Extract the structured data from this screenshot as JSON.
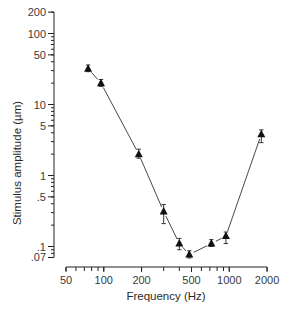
{
  "chart_data": {
    "type": "line",
    "title": "",
    "xlabel": "Frequency (Hz)",
    "ylabel": "Stimulus amplitude (µm)",
    "xscale": "log",
    "yscale": "log",
    "xlim": [
      50,
      2000
    ],
    "ylim": [
      0.07,
      200
    ],
    "x_ticks": [
      50,
      100,
      200,
      500,
      1000,
      2000
    ],
    "x_tick_labels": [
      "50",
      "100",
      "200",
      "500",
      "1000",
      "2000"
    ],
    "y_ticks": [
      0.07,
      0.1,
      0.5,
      1,
      5,
      10,
      50,
      100,
      200
    ],
    "y_tick_labels": [
      ".07",
      ".1",
      ".5",
      "1",
      "5",
      "10",
      "50",
      "100",
      "200"
    ],
    "grid": false,
    "legend": null,
    "marker": "filled-triangle",
    "error_bars": true,
    "series": [
      {
        "name": "threshold",
        "x": [
          75,
          95,
          190,
          300,
          400,
          480,
          720,
          940,
          1800
        ],
        "y": [
          32,
          20,
          2.0,
          0.31,
          0.11,
          0.077,
          0.11,
          0.14,
          3.8
        ],
        "err_low": [
          3,
          2,
          0.25,
          0.1,
          0.02,
          0.008,
          0.01,
          0.03,
          0.9
        ],
        "err_high": [
          4,
          2.5,
          0.35,
          0.08,
          0.02,
          0.01,
          0.015,
          0.02,
          0.6
        ]
      }
    ]
  }
}
